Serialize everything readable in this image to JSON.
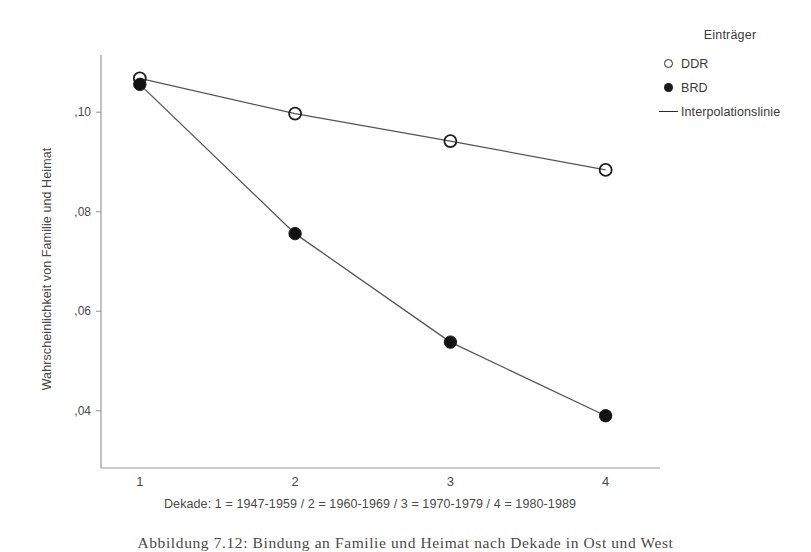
{
  "chart_data": {
    "type": "line",
    "title": "",
    "xlabel": "Dekade: 1 = 1947-1959 / 2 = 1960-1969 / 3 = 1970-1979 / 4 = 1980-1989",
    "ylabel": "Wahrscheinlichkeit von Familie und Heimat",
    "categories": [
      "1",
      "2",
      "3",
      "4"
    ],
    "x": [
      1,
      2,
      3,
      4
    ],
    "xlim": [
      0.75,
      4.35
    ],
    "ylim": [
      0.0285,
      0.1115
    ],
    "yticks": [
      0.04,
      0.06,
      0.08,
      0.1
    ],
    "ytick_labels": [
      ",04",
      ",06",
      ",08",
      ",10"
    ],
    "xtick_labels": [
      "1",
      "2",
      "3",
      "4"
    ],
    "grid": false,
    "legend_position": "right-top",
    "series": [
      {
        "name": "DDR",
        "marker": "open-circle",
        "values": [
          0.1068,
          0.0997,
          0.0942,
          0.0884
        ]
      },
      {
        "name": "BRD",
        "marker": "filled-circle",
        "values": [
          0.1056,
          0.0756,
          0.0538,
          0.039
        ]
      }
    ]
  },
  "legend": {
    "title": "Einträger",
    "items": [
      {
        "label": "DDR",
        "marker": "open-circle-icon"
      },
      {
        "label": "BRD",
        "marker": "filled-circle-icon"
      },
      {
        "label": "Interpolationslinie",
        "marker": "line-icon"
      }
    ]
  },
  "axes": {
    "y_title": "Wahrscheinlichkeit von Familie und Heimat",
    "x_title": "Dekade: 1 = 1947-1959 / 2 = 1960-1969 / 3 = 1970-1979 / 4 = 1980-1989",
    "y_tick_labels": [
      ",10",
      ",08",
      ",06",
      ",04"
    ],
    "x_tick_labels": [
      "1",
      "2",
      "3",
      "4"
    ]
  },
  "caption": {
    "text": "Abbildung 7.12: Bindung an Familie und Heimat nach Dekade in Ost und West"
  },
  "colors": {
    "axis": "#8a8a8a",
    "line": "#555555",
    "marker_fill": "#121212",
    "marker_stroke": "#1e1e1e",
    "text": "#3a3a3a",
    "background": "#ffffff"
  }
}
